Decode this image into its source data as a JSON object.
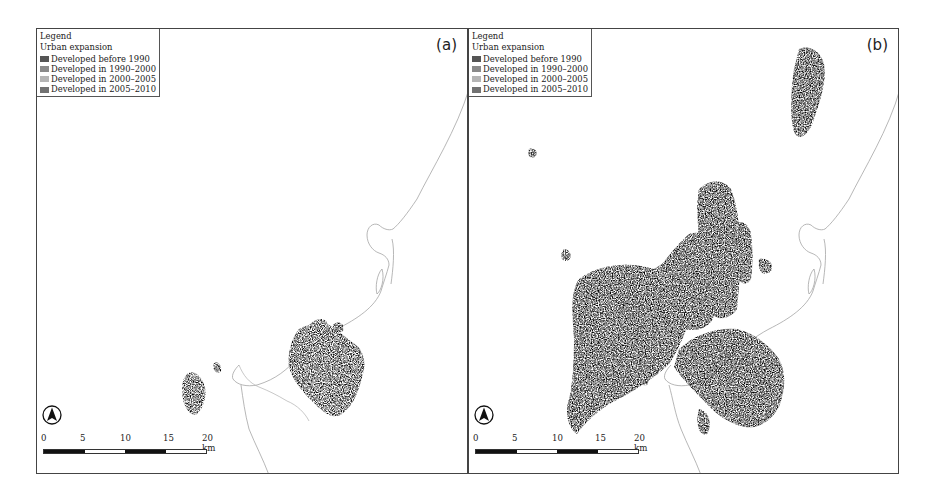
{
  "figure": {
    "panels": [
      {
        "id": "a",
        "label": "(a)",
        "legend": {
          "title": "Legend",
          "subtitle": "Urban expansion",
          "items": [
            {
              "label": "Developed before 1990",
              "color": "#555555"
            },
            {
              "label": "Developed in 1990–2000",
              "color": "#8a8a8a"
            },
            {
              "label": "Developed in 2000–2005",
              "color": "#b5b5b5"
            },
            {
              "label": "Developed in 2005–2010",
              "color": "#727272"
            }
          ]
        },
        "scale_bar": {
          "ticks": [
            "0",
            "5",
            "10",
            "15",
            "20 km"
          ]
        },
        "north_arrow": "north-arrow-icon"
      },
      {
        "id": "b",
        "label": "(b)",
        "legend": {
          "title": "Legend",
          "subtitle": "Urban expansion",
          "items": [
            {
              "label": "Developed before 1990",
              "color": "#555555"
            },
            {
              "label": "Developed in 1990–2000",
              "color": "#8a8a8a"
            },
            {
              "label": "Developed in 2000–2005",
              "color": "#b5b5b5"
            },
            {
              "label": "Developed in 2005–2010",
              "color": "#727272"
            }
          ]
        },
        "scale_bar": {
          "ticks": [
            "0",
            "5",
            "10",
            "15",
            "20 km"
          ]
        },
        "north_arrow": "north-arrow-icon"
      }
    ],
    "colors": {
      "coastline": "#9a9a9a",
      "frame": "#444444"
    }
  }
}
